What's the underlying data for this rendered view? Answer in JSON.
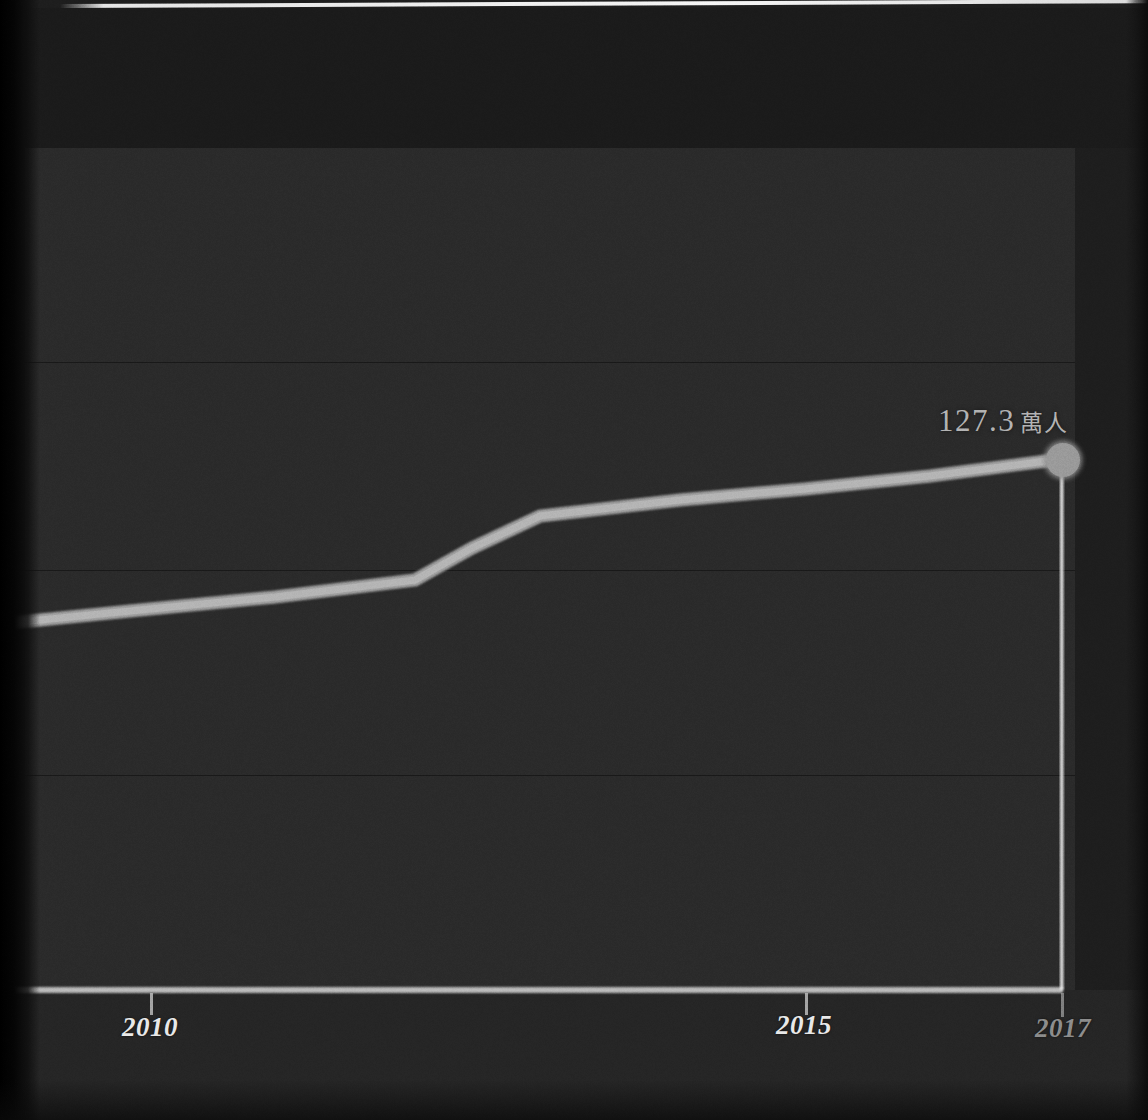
{
  "chart_data": {
    "type": "line",
    "title": "",
    "subtitle": "",
    "xlabel": "",
    "ylabel": "",
    "x": [
      2008,
      2009,
      2010,
      2011,
      2012,
      2013,
      2014,
      2015,
      2016,
      2017
    ],
    "series": [
      {
        "name": "人口",
        "values": [
          108.5,
          110.0,
          111.5,
          113.0,
          114.5,
          120.0,
          121.5,
          122.8,
          124.8,
          127.3
        ]
      }
    ],
    "xlim": [
      2008,
      2017
    ],
    "ylim": [
      60,
      150
    ],
    "grid": true,
    "gridlines_y": [
      140,
      120,
      100,
      80
    ],
    "legend": "none",
    "annotations": [
      {
        "label": "127.3 萬人",
        "value_number": "127.3",
        "value_unit": "萬人",
        "x": 2017,
        "y": 127.3,
        "marker": "circle",
        "drop_line": true
      }
    ]
  },
  "axis": {
    "x_ticks": [
      {
        "label": "2010",
        "value": 2010,
        "style": "bright"
      },
      {
        "label": "2015",
        "value": 2015,
        "style": "bright"
      },
      {
        "label": "2017",
        "value": 2017,
        "style": "dim"
      }
    ]
  },
  "colors": {
    "background": "#232323",
    "plot_background": "#2b2b2b",
    "line": "#b9b9b9",
    "marker": "#9a9a9a",
    "axis": "#cfcfcf",
    "gridline": "#1a1a1a",
    "tick_label": "#e9e9e9",
    "tick_label_dim": "#8e8e8e",
    "annotation": "#b4b4b4",
    "drop_line": "#f2f2f2"
  }
}
